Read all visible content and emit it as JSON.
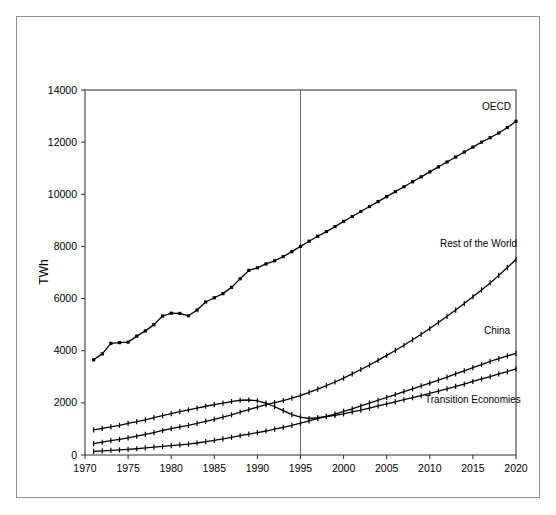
{
  "chart_data": {
    "type": "line",
    "title": "",
    "subtitle": "",
    "xlabel": "",
    "ylabel": "TWh",
    "xlim": [
      1970,
      2020
    ],
    "ylim": [
      0,
      14000
    ],
    "grid": false,
    "legend_position": "inline-right-end-labels",
    "xticks": [
      "1970",
      "1975",
      "1980",
      "1985",
      "1990",
      "1995",
      "2000",
      "2005",
      "2010",
      "2015",
      "2020"
    ],
    "xtick_values": [
      1970,
      1975,
      1980,
      1985,
      1990,
      1995,
      2000,
      2005,
      2010,
      2015,
      2020
    ],
    "yticks": [
      "0",
      "2000",
      "4000",
      "6000",
      "8000",
      "10000",
      "12000",
      "14000"
    ],
    "ytick_values": [
      0,
      2000,
      4000,
      6000,
      8000,
      10000,
      12000,
      14000
    ],
    "annotations": [
      {
        "name": "history-projection-divider",
        "type": "vline",
        "x": 1995
      }
    ],
    "x": [
      1971,
      1972,
      1973,
      1974,
      1975,
      1976,
      1977,
      1978,
      1979,
      1980,
      1981,
      1982,
      1983,
      1984,
      1985,
      1986,
      1987,
      1988,
      1989,
      1990,
      1991,
      1992,
      1993,
      1994,
      1995,
      1996,
      1997,
      1998,
      1999,
      2000,
      2001,
      2002,
      2003,
      2004,
      2005,
      2006,
      2007,
      2008,
      2009,
      2010,
      2011,
      2012,
      2013,
      2014,
      2015,
      2016,
      2017,
      2018,
      2019,
      2020
    ],
    "series": [
      {
        "name": "OECD",
        "label": "OECD",
        "color": "#000000",
        "marker": "square",
        "values": [
          3650,
          3880,
          4280,
          4310,
          4330,
          4560,
          4760,
          5000,
          5330,
          5440,
          5430,
          5340,
          5560,
          5870,
          6030,
          6190,
          6430,
          6760,
          7080,
          7180,
          7330,
          7450,
          7610,
          7800,
          8000,
          8200,
          8390,
          8570,
          8760,
          8960,
          9150,
          9340,
          9530,
          9720,
          9910,
          10100,
          10290,
          10480,
          10670,
          10860,
          11050,
          11240,
          11430,
          11620,
          11810,
          12000,
          12170,
          12350,
          12560,
          12800
        ]
      },
      {
        "name": "Rest of the World",
        "label": "Rest of the World",
        "color": "#000000",
        "marker": "plus",
        "values": [
          440,
          490,
          550,
          600,
          660,
          720,
          790,
          860,
          940,
          1010,
          1080,
          1140,
          1210,
          1290,
          1370,
          1450,
          1540,
          1640,
          1740,
          1840,
          1930,
          2010,
          2090,
          2180,
          2280,
          2400,
          2530,
          2660,
          2800,
          2950,
          3110,
          3280,
          3450,
          3630,
          3820,
          4010,
          4210,
          4420,
          4630,
          4850,
          5080,
          5320,
          5560,
          5810,
          6070,
          6330,
          6600,
          6890,
          7190,
          7500
        ]
      },
      {
        "name": "China",
        "label": "China",
        "color": "#000000",
        "marker": "plus",
        "values": [
          140,
          160,
          180,
          195,
          215,
          240,
          270,
          300,
          330,
          360,
          390,
          420,
          460,
          510,
          560,
          620,
          680,
          740,
          800,
          860,
          920,
          990,
          1060,
          1140,
          1220,
          1310,
          1400,
          1480,
          1570,
          1670,
          1770,
          1880,
          1990,
          2100,
          2210,
          2320,
          2430,
          2540,
          2650,
          2760,
          2870,
          2990,
          3110,
          3230,
          3350,
          3470,
          3590,
          3700,
          3800,
          3900
        ]
      },
      {
        "name": "Transition Economies",
        "label": "Transition Economies",
        "color": "#000000",
        "marker": "plus",
        "values": [
          960,
          1020,
          1080,
          1140,
          1210,
          1280,
          1350,
          1430,
          1510,
          1590,
          1660,
          1730,
          1800,
          1870,
          1930,
          1990,
          2050,
          2100,
          2110,
          2080,
          1990,
          1850,
          1700,
          1550,
          1450,
          1400,
          1430,
          1470,
          1520,
          1580,
          1650,
          1720,
          1800,
          1880,
          1960,
          2040,
          2120,
          2200,
          2280,
          2360,
          2450,
          2540,
          2630,
          2720,
          2820,
          2920,
          3010,
          3110,
          3200,
          3300
        ]
      }
    ]
  },
  "labels": {
    "y_axis_title": "TWh",
    "oecd": "OECD",
    "rest_of_world": "Rest of the World",
    "china": "China",
    "transition": "Transition Economies"
  }
}
